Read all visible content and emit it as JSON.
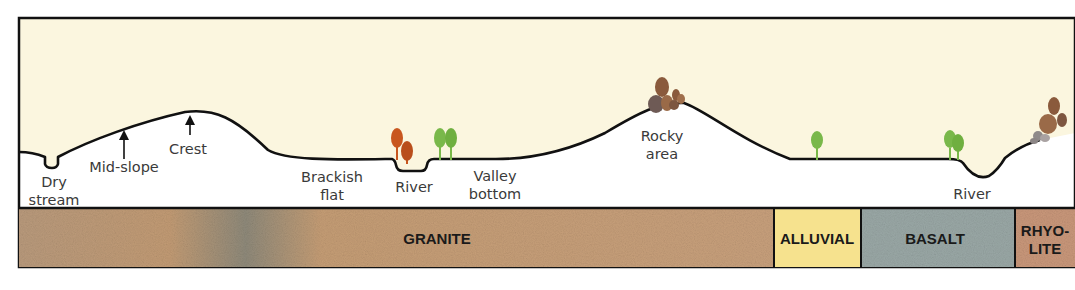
{
  "diagram": {
    "type": "landscape-cross-section",
    "colors": {
      "sky": "#fbf6df",
      "profile_line": "#111111",
      "border": "#111111",
      "label_text": "#3a3a3a",
      "tree_orange": "#c8561e",
      "tree_green": "#79b84a",
      "rock_brown": "#8a5a3c"
    },
    "landforms": [
      {
        "id": "dry-stream",
        "line1": "Dry",
        "line2": "stream"
      },
      {
        "id": "mid-slope",
        "line1": "Mid-slope"
      },
      {
        "id": "crest",
        "line1": "Crest"
      },
      {
        "id": "brackish-flat",
        "line1": "Brackish",
        "line2": "flat"
      },
      {
        "id": "river-1",
        "line1": "River"
      },
      {
        "id": "valley-bottom",
        "line1": "Valley",
        "line2": "bottom"
      },
      {
        "id": "rocky-area",
        "line1": "Rocky",
        "line2": "area"
      },
      {
        "id": "river-2",
        "line1": "River"
      }
    ],
    "geology": [
      {
        "id": "granite",
        "label": "GRANITE",
        "color": "#c39a72"
      },
      {
        "id": "alluvial",
        "label": "ALLUVIAL",
        "color": "#f6e28e"
      },
      {
        "id": "basalt",
        "label": "BASALT",
        "color": "#9aa8a6"
      },
      {
        "id": "rhyolite",
        "line1": "RHYO-",
        "line2": "LITE",
        "color": "#c9977a"
      }
    ]
  }
}
